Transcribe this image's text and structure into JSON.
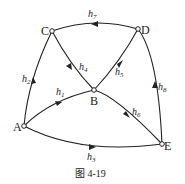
{
  "diagram": {
    "nodes": [
      {
        "id": "A",
        "label": "A",
        "x": 24,
        "y": 126
      },
      {
        "id": "B",
        "label": "B",
        "x": 94,
        "y": 90
      },
      {
        "id": "C",
        "label": "C",
        "x": 52,
        "y": 31
      },
      {
        "id": "D",
        "label": "D",
        "x": 138,
        "y": 29
      },
      {
        "id": "E",
        "label": "E",
        "x": 162,
        "y": 144
      }
    ],
    "edges": [
      {
        "id": "h1",
        "label": "h",
        "sub": "1",
        "from": "A",
        "to": "B"
      },
      {
        "id": "h2",
        "label": "h",
        "sub": "2",
        "from": "A",
        "to": "C"
      },
      {
        "id": "h3",
        "label": "h",
        "sub": "3",
        "from": "A",
        "to": "E"
      },
      {
        "id": "h4",
        "label": "h",
        "sub": "4",
        "from": "B",
        "to": "C"
      },
      {
        "id": "h5",
        "label": "h",
        "sub": "5",
        "from": "B",
        "to": "D"
      },
      {
        "id": "h6",
        "label": "h",
        "sub": "6",
        "from": "B",
        "to": "E"
      },
      {
        "id": "h7",
        "label": "h",
        "sub": "7",
        "from": "D",
        "to": "C"
      },
      {
        "id": "h8",
        "label": "h",
        "sub": "8",
        "from": "E",
        "to": "D"
      }
    ],
    "caption": "图 4-19"
  }
}
